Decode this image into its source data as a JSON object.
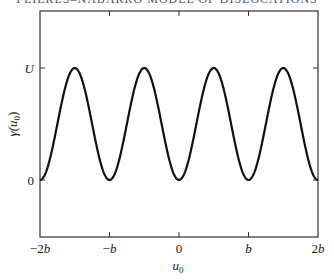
{
  "header": {
    "running_title": "PEIERLS–NABARRO MODEL OF DISLOCATIONS"
  },
  "chart_data": {
    "type": "line",
    "title": "",
    "xlabel": "u0",
    "ylabel": "γ(u0)",
    "x_tick_labels": [
      "−2b",
      "−b",
      "0",
      "b",
      "2b"
    ],
    "x_tick_values": [
      -2,
      -1,
      0,
      1,
      2
    ],
    "y_tick_labels": [
      "0",
      "U"
    ],
    "y_tick_values": [
      0,
      1
    ],
    "xlim": [
      -2,
      2
    ],
    "ylim": [
      -0.55,
      1.6
    ],
    "grid": false,
    "legend": null,
    "series": [
      {
        "name": "γ(u0) = (U/2)(1 − cos(2πu0/b))",
        "x": [
          -2,
          -1.75,
          -1.5,
          -1.25,
          -1,
          -0.75,
          -0.5,
          -0.25,
          0,
          0.25,
          0.5,
          0.75,
          1,
          1.25,
          1.5,
          1.75,
          2
        ],
        "values": [
          0,
          0.5,
          1,
          0.5,
          0,
          0.5,
          1,
          0.5,
          0,
          0.5,
          1,
          0.5,
          0,
          0.5,
          1,
          0.5,
          0
        ]
      }
    ],
    "color": "#111111"
  },
  "labels": {
    "x_axis_label": "u",
    "x_axis_sub": "0",
    "y_axis_label": "γ(u",
    "y_axis_sub": "0",
    "y_axis_close": ")"
  }
}
